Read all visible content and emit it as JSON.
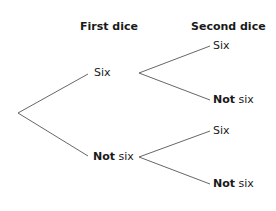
{
  "headers": {
    "first": "First dice",
    "second": "Second dice"
  },
  "tree": {
    "first_level": [
      {
        "bold": "",
        "text": "Six"
      },
      {
        "bold": "Not",
        "text": " six"
      }
    ],
    "second_level": [
      {
        "bold": "",
        "text": "Six"
      },
      {
        "bold": "Not",
        "text": " six"
      },
      {
        "bold": "",
        "text": "Six"
      },
      {
        "bold": "Not",
        "text": " six"
      }
    ]
  },
  "colors": {
    "line": "#555555",
    "text": "#1a1a1a"
  }
}
